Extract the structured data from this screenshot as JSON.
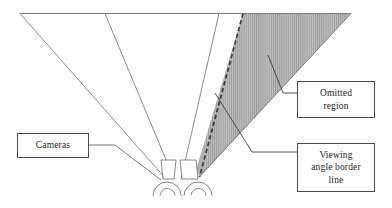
{
  "figure": {
    "type": "line-diagram",
    "caption_boxes": [
      {
        "id": "cameras",
        "label": "Cameras"
      },
      {
        "id": "omitted",
        "label": "Omitted\nregion"
      },
      {
        "id": "viewing",
        "label": "Viewing\nangle border\nline"
      }
    ],
    "colors": {
      "stroke": "#4a4a4a",
      "thin_stroke": "#6b6b6b",
      "hatch_fill": "#b0b0b0",
      "hatch_line": "#8c8c8c",
      "background": "#ffffff",
      "text": "#1b1b1b"
    },
    "elements": {
      "top_baseline_label": "scene top edge",
      "left_camera_cone_label": "left camera viewing cone",
      "right_camera_cone_label": "right camera viewing cone",
      "dashed_line_label": "viewing angle border line",
      "shaded_region_label": "omitted region",
      "camera_left_label": "camera body left",
      "camera_right_label": "camera body right",
      "lens_left_label": "camera lens left",
      "lens_right_label": "camera lens right"
    }
  }
}
